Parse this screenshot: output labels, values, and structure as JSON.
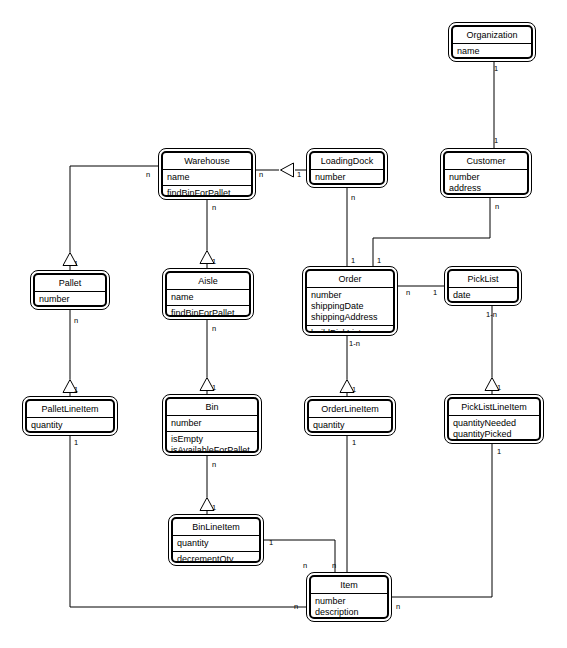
{
  "diagram": {
    "type": "uml-class-diagram",
    "background_color": "#ffffff",
    "line_color": "#000000",
    "text_color": "#000000"
  },
  "classes": [
    {
      "id": "organization",
      "name": "Organization",
      "attributes": [
        "name"
      ],
      "operations": [],
      "x": 448,
      "y": 22,
      "w": 88,
      "h": 40
    },
    {
      "id": "warehouse",
      "name": "Warehouse",
      "attributes": [
        "name"
      ],
      "operations": [
        "findBinForPallet"
      ],
      "x": 158,
      "y": 148,
      "w": 98,
      "h": 52
    },
    {
      "id": "loadingdock",
      "name": "LoadingDock",
      "attributes": [
        "number"
      ],
      "operations": [],
      "x": 306,
      "y": 148,
      "w": 82,
      "h": 40
    },
    {
      "id": "customer",
      "name": "Customer",
      "attributes": [
        "number",
        "address"
      ],
      "operations": [],
      "x": 440,
      "y": 148,
      "w": 92,
      "h": 50
    },
    {
      "id": "pallet",
      "name": "Pallet",
      "attributes": [
        "number"
      ],
      "operations": [],
      "x": 30,
      "y": 270,
      "w": 80,
      "h": 40
    },
    {
      "id": "aisle",
      "name": "Aisle",
      "attributes": [
        "name"
      ],
      "operations": [
        "findBinForPallet"
      ],
      "x": 162,
      "y": 268,
      "w": 92,
      "h": 52
    },
    {
      "id": "order",
      "name": "Order",
      "attributes": [
        "number",
        "shippingDate",
        "shippingAddress"
      ],
      "operations": [
        "buildPickList"
      ],
      "x": 302,
      "y": 266,
      "w": 96,
      "h": 70
    },
    {
      "id": "picklist",
      "name": "PickList",
      "attributes": [
        "date"
      ],
      "operations": [],
      "x": 444,
      "y": 266,
      "w": 78,
      "h": 40
    },
    {
      "id": "palletlineitem",
      "name": "PalletLineItem",
      "attributes": [
        "quantity"
      ],
      "operations": [],
      "x": 22,
      "y": 396,
      "w": 96,
      "h": 40
    },
    {
      "id": "bin",
      "name": "Bin",
      "attributes": [
        "number"
      ],
      "operations": [
        "isEmpty",
        "isAvailableForPallet"
      ],
      "x": 162,
      "y": 394,
      "w": 100,
      "h": 62
    },
    {
      "id": "orderlineitem",
      "name": "OrderLineItem",
      "attributes": [
        "quantity"
      ],
      "operations": [],
      "x": 304,
      "y": 396,
      "w": 92,
      "h": 40
    },
    {
      "id": "picklistlineitem",
      "name": "PickListLineItem",
      "attributes": [
        "quantityNeeded",
        "quantityPicked"
      ],
      "operations": [],
      "x": 444,
      "y": 394,
      "w": 100,
      "h": 50
    },
    {
      "id": "binlineitem",
      "name": "BinLineItem",
      "attributes": [
        "quantity"
      ],
      "operations": [
        "decrementQty"
      ],
      "x": 168,
      "y": 514,
      "w": 96,
      "h": 52
    },
    {
      "id": "item",
      "name": "Item",
      "attributes": [
        "number",
        "description"
      ],
      "operations": [],
      "x": 306,
      "y": 572,
      "w": 86,
      "h": 50
    }
  ],
  "relationships": [
    {
      "id": "org-customer",
      "from": "organization",
      "to": "customer",
      "kind": "association",
      "from_multiplicity": "1",
      "to_multiplicity": "1"
    },
    {
      "id": "warehouse-loadingdock",
      "from": "warehouse",
      "to": "loadingdock",
      "kind": "aggregation",
      "from_multiplicity": "n",
      "to_multiplicity": "1"
    },
    {
      "id": "warehouse-pallet",
      "from": "warehouse",
      "to": "pallet",
      "kind": "aggregation",
      "from_multiplicity": "n",
      "to_multiplicity": "1"
    },
    {
      "id": "warehouse-aisle",
      "from": "warehouse",
      "to": "aisle",
      "kind": "aggregation",
      "from_multiplicity": "n",
      "to_multiplicity": "1"
    },
    {
      "id": "loadingdock-order",
      "from": "loadingdock",
      "to": "order",
      "kind": "association",
      "from_multiplicity": "n",
      "to_multiplicity": "1"
    },
    {
      "id": "customer-order",
      "from": "customer",
      "to": "order",
      "kind": "association",
      "from_multiplicity": "n",
      "to_multiplicity": "1"
    },
    {
      "id": "order-picklist",
      "from": "order",
      "to": "picklist",
      "kind": "association",
      "from_multiplicity": "n",
      "to_multiplicity": "1"
    },
    {
      "id": "pallet-palletlineitem",
      "from": "pallet",
      "to": "palletlineitem",
      "kind": "aggregation",
      "from_multiplicity": "n",
      "to_multiplicity": "1"
    },
    {
      "id": "aisle-bin",
      "from": "aisle",
      "to": "bin",
      "kind": "aggregation",
      "from_multiplicity": "n",
      "to_multiplicity": "1"
    },
    {
      "id": "order-orderlineitem",
      "from": "order",
      "to": "orderlineitem",
      "kind": "aggregation",
      "from_multiplicity": "1-n",
      "to_multiplicity": "1"
    },
    {
      "id": "picklist-picklistlineitem",
      "from": "picklist",
      "to": "picklistlineitem",
      "kind": "aggregation",
      "from_multiplicity": "1-n",
      "to_multiplicity": "1"
    },
    {
      "id": "bin-binlineitem",
      "from": "bin",
      "to": "binlineitem",
      "kind": "aggregation",
      "from_multiplicity": "n",
      "to_multiplicity": "1"
    },
    {
      "id": "binlineitem-item",
      "from": "binlineitem",
      "to": "item",
      "kind": "association",
      "from_multiplicity": "1",
      "to_multiplicity": "n"
    },
    {
      "id": "orderlineitem-item",
      "from": "orderlineitem",
      "to": "item",
      "kind": "association",
      "from_multiplicity": "1",
      "to_multiplicity": "n"
    },
    {
      "id": "palletlineitem-item",
      "from": "palletlineitem",
      "to": "item",
      "kind": "association",
      "from_multiplicity": "1",
      "to_multiplicity": "n"
    },
    {
      "id": "picklistlineitem-item",
      "from": "picklistlineitem",
      "to": "item",
      "kind": "association",
      "from_multiplicity": "1",
      "to_multiplicity": "n"
    }
  ],
  "multiplicity_labels": [
    {
      "id": "m-org-bottom",
      "text": "1",
      "x": 494,
      "y": 64
    },
    {
      "id": "m-customer-top",
      "text": "1",
      "x": 494,
      "y": 136
    },
    {
      "id": "m-warehouse-left",
      "text": "n",
      "x": 146,
      "y": 170
    },
    {
      "id": "m-warehouse-right",
      "text": "n",
      "x": 259,
      "y": 170
    },
    {
      "id": "m-loadingdock-left",
      "text": "1",
      "x": 297,
      "y": 170
    },
    {
      "id": "m-warehouse-bottom",
      "text": "n",
      "x": 212,
      "y": 203
    },
    {
      "id": "m-loadingdock-bottom",
      "text": "n",
      "x": 351,
      "y": 193
    },
    {
      "id": "m-customer-bottom",
      "text": "n",
      "x": 495,
      "y": 202
    },
    {
      "id": "m-pallet-top",
      "text": "1",
      "x": 74,
      "y": 259
    },
    {
      "id": "m-aisle-top",
      "text": "1",
      "x": 212,
      "y": 257
    },
    {
      "id": "m-order-top-left",
      "text": "1",
      "x": 351,
      "y": 256
    },
    {
      "id": "m-order-top-right",
      "text": "1",
      "x": 377,
      "y": 256
    },
    {
      "id": "m-order-right",
      "text": "n",
      "x": 406,
      "y": 288
    },
    {
      "id": "m-picklist-left",
      "text": "1",
      "x": 433,
      "y": 288
    },
    {
      "id": "m-pallet-bottom",
      "text": "n",
      "x": 74,
      "y": 316
    },
    {
      "id": "m-aisle-bottom",
      "text": "n",
      "x": 212,
      "y": 324
    },
    {
      "id": "m-order-bottom",
      "text": "1-n",
      "x": 349,
      "y": 339
    },
    {
      "id": "m-picklist-bottom",
      "text": "1-n",
      "x": 486,
      "y": 310
    },
    {
      "id": "m-palletlineitem-top",
      "text": "1",
      "x": 74,
      "y": 385
    },
    {
      "id": "m-bin-top",
      "text": "1",
      "x": 212,
      "y": 383
    },
    {
      "id": "m-orderlineitem-top",
      "text": "1",
      "x": 352,
      "y": 385
    },
    {
      "id": "m-picklistlineitem-top",
      "text": "1",
      "x": 497,
      "y": 383
    },
    {
      "id": "m-palletlineitem-bottom",
      "text": "1",
      "x": 74,
      "y": 438
    },
    {
      "id": "m-bin-bottom",
      "text": "n",
      "x": 212,
      "y": 460
    },
    {
      "id": "m-orderlineitem-bottom",
      "text": "1",
      "x": 352,
      "y": 438
    },
    {
      "id": "m-picklistlineitem-bottom",
      "text": "1",
      "x": 497,
      "y": 447
    },
    {
      "id": "m-binlineitem-top",
      "text": "1",
      "x": 212,
      "y": 503
    },
    {
      "id": "m-binlineitem-right",
      "text": "1",
      "x": 269,
      "y": 538
    },
    {
      "id": "m-item-top-left",
      "text": "n",
      "x": 303,
      "y": 561
    },
    {
      "id": "m-item-top-right",
      "text": "n",
      "x": 332,
      "y": 561
    },
    {
      "id": "m-item-left",
      "text": "n",
      "x": 294,
      "y": 602
    },
    {
      "id": "m-item-right",
      "text": "n",
      "x": 396,
      "y": 602
    }
  ],
  "edges_geometry": {
    "lines": [
      {
        "id": "l-org-customer",
        "pts": "494,62 494,148"
      },
      {
        "id": "l-wh-ld-a",
        "pts": "256,170 279,170"
      },
      {
        "id": "l-wh-ld-b",
        "pts": "295,170 306,170"
      },
      {
        "id": "l-wh-pallet",
        "pts": "158,166 70,166 70,252"
      },
      {
        "id": "l-pallet-tri-stem",
        "pts": "70,266 70,270"
      },
      {
        "id": "l-wh-aisle",
        "pts": "207,200 207,250"
      },
      {
        "id": "l-aisle-tri-stem",
        "pts": "207,264 207,268"
      },
      {
        "id": "l-ld-order",
        "pts": "347,188 347,266"
      },
      {
        "id": "l-cust-order-v1",
        "pts": "490,198 490,238"
      },
      {
        "id": "l-cust-order-h",
        "pts": "490,238 373,238"
      },
      {
        "id": "l-cust-order-v2",
        "pts": "373,238 373,266"
      },
      {
        "id": "l-order-picklist",
        "pts": "398,286 444,286"
      },
      {
        "id": "l-pallet-pli",
        "pts": "70,310 70,379"
      },
      {
        "id": "l-pli-tri-stem",
        "pts": "70,393 70,396"
      },
      {
        "id": "l-aisle-bin",
        "pts": "207,320 207,377"
      },
      {
        "id": "l-bin-tri-stem",
        "pts": "207,391 207,394"
      },
      {
        "id": "l-order-oli",
        "pts": "347,336 347,379"
      },
      {
        "id": "l-oli-tri-stem",
        "pts": "347,393 347,396"
      },
      {
        "id": "l-picklist-pllitem",
        "pts": "492,306 492,377"
      },
      {
        "id": "l-pllitem-tri-stem",
        "pts": "492,391 492,394"
      },
      {
        "id": "l-bin-bli",
        "pts": "207,456 207,497"
      },
      {
        "id": "l-bli-tri-stem",
        "pts": "207,511 207,514"
      },
      {
        "id": "l-bli-item-h",
        "pts": "264,540 335,540"
      },
      {
        "id": "l-bli-item-v",
        "pts": "335,540 335,572"
      },
      {
        "id": "l-oli-item",
        "pts": "347,436 347,572"
      },
      {
        "id": "l-pli-item-v",
        "pts": "70,436 70,607"
      },
      {
        "id": "l-pli-item-h",
        "pts": "70,607 306,607"
      },
      {
        "id": "l-pllitem-item-v",
        "pts": "492,444 492,597"
      },
      {
        "id": "l-pllitem-item-h",
        "pts": "492,597 392,597"
      }
    ],
    "triangles": [
      {
        "id": "tri-loadingdock-warehouse",
        "orientation": "left",
        "cx": 287,
        "cy": 170
      },
      {
        "id": "tri-pallet-warehouse",
        "orientation": "up",
        "cx": 70,
        "cy": 259
      },
      {
        "id": "tri-aisle-warehouse",
        "orientation": "up",
        "cx": 207,
        "cy": 257
      },
      {
        "id": "tri-palletlineitem-pallet",
        "orientation": "up",
        "cx": 70,
        "cy": 386
      },
      {
        "id": "tri-bin-aisle",
        "orientation": "up",
        "cx": 207,
        "cy": 384
      },
      {
        "id": "tri-orderlineitem-order",
        "orientation": "up",
        "cx": 347,
        "cy": 386
      },
      {
        "id": "tri-picklistlineitem-picklist",
        "orientation": "up",
        "cx": 492,
        "cy": 384
      },
      {
        "id": "tri-binlineitem-bin",
        "orientation": "up",
        "cx": 207,
        "cy": 504
      }
    ]
  }
}
